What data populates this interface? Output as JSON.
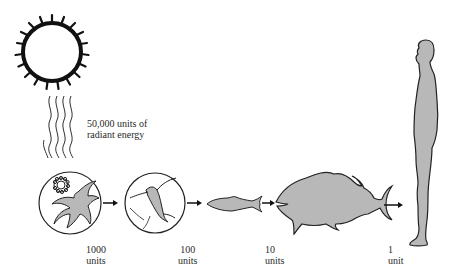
{
  "diagram": {
    "source": {
      "name": "sun",
      "label_line1": "50,000 units of",
      "label_line2": "radiant energy",
      "value": 50000
    },
    "stages": [
      {
        "name": "phytoplankton",
        "value_text": "1000",
        "unit_text": "units",
        "value": 1000
      },
      {
        "name": "zooplankton",
        "value_text": "100",
        "unit_text": "units",
        "value": 100
      },
      {
        "name": "small-fish",
        "value_text": "",
        "unit_text": "",
        "value": null
      },
      {
        "name": "large-fish",
        "value_text": "10",
        "unit_text": "units",
        "value": 10
      },
      {
        "name": "human",
        "value_text": "1",
        "unit_text": "unit",
        "value": 1
      }
    ],
    "colors": {
      "outline": "#111111",
      "fill": "#b8b8b8",
      "background": "#ffffff"
    }
  }
}
